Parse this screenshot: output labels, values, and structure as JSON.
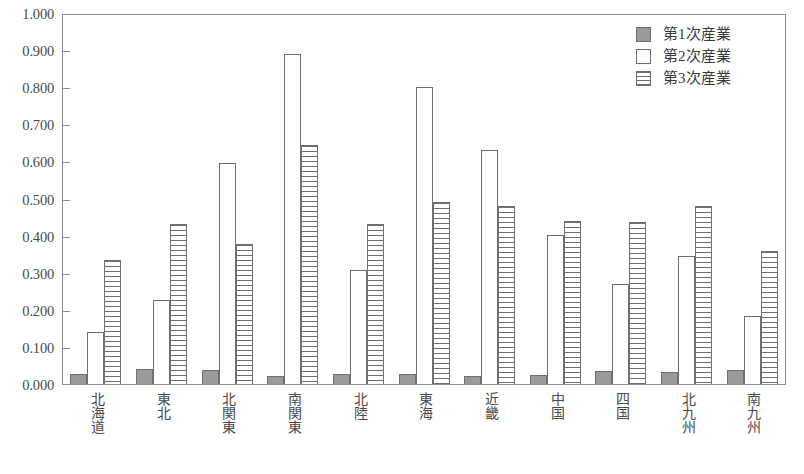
{
  "chart_data": {
    "type": "bar",
    "title": "",
    "subtitle": "",
    "xlabel": "",
    "ylabel": "",
    "ylim": [
      0.0,
      1.0
    ],
    "ytick_step": 0.1,
    "grid": false,
    "legend_position": "top-right",
    "ytick_labels": [
      "1.000",
      "0.900",
      "0.800",
      "0.700",
      "0.600",
      "0.500",
      "0.400",
      "0.300",
      "0.200",
      "0.100",
      "0.000"
    ],
    "categories": [
      "北海道",
      "東北",
      "北関東",
      "南関東",
      "北陸",
      "東海",
      "近畿",
      "中国",
      "四国",
      "北九州",
      "南九州"
    ],
    "series": [
      {
        "name": "第1次産業",
        "fill": "solid-gray",
        "color": "#9a9a9a",
        "values": [
          0.028,
          0.04,
          0.038,
          0.022,
          0.026,
          0.027,
          0.021,
          0.025,
          0.035,
          0.032,
          0.038
        ]
      },
      {
        "name": "第2次産業",
        "fill": "white",
        "color": "#ffffff",
        "values": [
          0.14,
          0.228,
          0.6,
          0.895,
          0.308,
          0.805,
          0.635,
          0.405,
          0.27,
          0.348,
          0.185
        ]
      },
      {
        "name": "第3次産業",
        "fill": "horizontal-stripes",
        "color": "#6f6f6f",
        "values": [
          0.335,
          0.435,
          0.38,
          0.648,
          0.435,
          0.492,
          0.483,
          0.443,
          0.44,
          0.482,
          0.36
        ]
      }
    ]
  },
  "legend": {
    "items": [
      {
        "label": "第1次産業",
        "swatch": "solid-gray-swatch"
      },
      {
        "label": "第2次産業",
        "swatch": "white-swatch"
      },
      {
        "label": "第3次産業",
        "swatch": "striped-swatch"
      }
    ]
  },
  "colors": {
    "series1": "#9a9a9a",
    "series2": "#ffffff",
    "series3_stripe": "#6f6f6f",
    "axis": "#8c8c8c",
    "text": "#3a3a3a",
    "background": "#ffffff"
  }
}
